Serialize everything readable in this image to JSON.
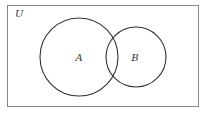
{
  "diagram": {
    "type": "venn",
    "universe_label": "U",
    "sets": [
      {
        "label": "A",
        "cx": 79,
        "cy": 57,
        "r": 39
      },
      {
        "label": "B",
        "cx": 136,
        "cy": 57,
        "r": 30
      }
    ],
    "colors": {
      "stroke": "#333333",
      "frame": "#888888",
      "background": "#ffffff"
    }
  }
}
